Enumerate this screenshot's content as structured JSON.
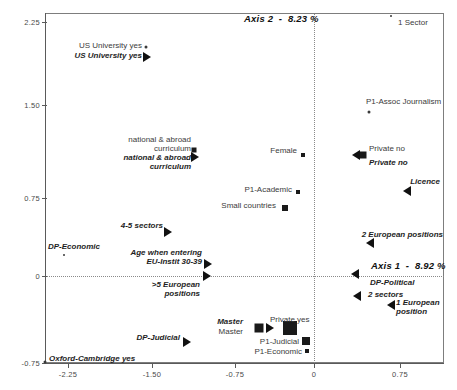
{
  "chart_data": {
    "type": "scatter",
    "title": "",
    "xlabel": "Axis 1 - 8.92 %",
    "ylabel": "Axis 2 - 8.23 %",
    "axis1_label": "Axis 1  -  8.92 %",
    "axis2_label": "Axis 2  -  8.23 %",
    "axis1_inertia_pct": 8.92,
    "axis2_inertia_pct": 8.23,
    "grid": "zero-axes-dotted",
    "legend": "none",
    "xlim": [
      -2.72,
      1.13
    ],
    "ylim": [
      -0.8,
      2.37
    ],
    "xticks": [
      -2.25,
      -1.5,
      -0.75,
      0,
      0.75
    ],
    "xticklabels": [
      "-2.25",
      "-1.50",
      "-0.75",
      "0",
      "0.75"
    ],
    "yticks": [
      2.25,
      1.5,
      0.75,
      0,
      -0.75
    ],
    "yticklabels": [
      "2.25",
      "1.50",
      "0.75",
      "0",
      "-0.75"
    ],
    "points": [
      {
        "label": "1 Sector",
        "style": "reg",
        "x": 0.7,
        "y": 2.28,
        "marker": "dot",
        "size": 2,
        "lx": 398,
        "ly": 19,
        "anchor": "left",
        "mx": 391,
        "my": 16
      },
      {
        "label": "US University yes",
        "style": "reg",
        "x": -1.53,
        "y": 2.03,
        "marker": "dot",
        "size": 3,
        "lx": 142,
        "ly": 42,
        "anchor": "right",
        "mx": 146,
        "my": 47
      },
      {
        "label": "US University yes",
        "style": "ital",
        "x": -1.53,
        "y": 1.98,
        "marker": "tri-r",
        "size": 0,
        "lx": 142,
        "ly": 52,
        "anchor": "right",
        "mx": 147,
        "my": 57
      },
      {
        "label": "P1-Assoc Journalism",
        "style": "reg",
        "x": 0.49,
        "y": 1.45,
        "marker": "dot",
        "size": 3,
        "lx": 366,
        "ly": 98,
        "anchor": "left",
        "mx": 369,
        "my": 112
      },
      {
        "label": "national & abroad\ncurriculum",
        "style": "reg",
        "x": -1.09,
        "y": 1.09,
        "marker": "sq",
        "size": 5,
        "lx": 191,
        "ly": 136,
        "anchor": "right",
        "mx": 194,
        "my": 150
      },
      {
        "label": "national & abroad\ncurriculum",
        "style": "ital",
        "x": -1.09,
        "y": 1.03,
        "marker": "tri-r",
        "size": 0,
        "lx": 191,
        "ly": 154,
        "anchor": "right",
        "mx": 195,
        "my": 157
      },
      {
        "label": "Female",
        "style": "reg",
        "x": -0.09,
        "y": 1.04,
        "marker": "sq",
        "size": 4,
        "lx": 297,
        "ly": 147,
        "anchor": "right",
        "mx": 303,
        "my": 155
      },
      {
        "label": "Private no",
        "style": "reg",
        "x": 0.44,
        "y": 1.04,
        "marker": "sq",
        "size": 7,
        "lx": 369,
        "ly": 145,
        "anchor": "left",
        "mx": 363,
        "my": 155
      },
      {
        "label": "Private no",
        "style": "ital",
        "x": 0.44,
        "y": 1.01,
        "marker": "tri-l",
        "size": 0,
        "lx": 369,
        "ly": 159,
        "anchor": "left",
        "mx": 356,
        "my": 155
      },
      {
        "label": "Licence",
        "style": "ital",
        "x": 0.81,
        "y": 0.84,
        "marker": "tri-l",
        "size": 0,
        "lx": 440,
        "ly": 178,
        "anchor": "right",
        "mx": 407,
        "my": 191
      },
      {
        "label": "P1-Academic",
        "style": "reg",
        "x": -0.14,
        "y": 0.72,
        "marker": "sq",
        "size": 4,
        "lx": 292,
        "ly": 186,
        "anchor": "right",
        "mx": 298,
        "my": 192
      },
      {
        "label": "Small countries",
        "style": "reg",
        "x": -0.27,
        "y": 0.59,
        "marker": "sq",
        "size": 6,
        "lx": 276,
        "ly": 202,
        "anchor": "right",
        "mx": 285,
        "my": 208
      },
      {
        "label": "4-5 sectors",
        "style": "ital",
        "x": -1.32,
        "y": 0.41,
        "marker": "tri-r",
        "size": 0,
        "lx": 163,
        "ly": 222,
        "anchor": "right",
        "mx": 168,
        "my": 232
      },
      {
        "label": "2 European positions",
        "style": "ital",
        "x": 0.5,
        "y": 0.3,
        "marker": "tri-l",
        "size": 0,
        "lx": 443,
        "ly": 231,
        "anchor": "right",
        "mx": 370,
        "my": 243
      },
      {
        "label": "DP-Economic",
        "style": "ital",
        "x": -2.23,
        "y": 0.18,
        "marker": "dot",
        "size": 2,
        "lx": 100,
        "ly": 243,
        "anchor": "right",
        "mx": 64,
        "my": 255
      },
      {
        "label": "Age when entering\nEU-Instit 30-39",
        "style": "ital",
        "x": -0.97,
        "y": 0.11,
        "marker": "tri-r",
        "size": 0,
        "lx": 202,
        "ly": 249,
        "anchor": "right",
        "mx": 208,
        "my": 264
      },
      {
        "label": "Axis 1  -  8.92 %",
        "style": "axis",
        "x": 0.4,
        "y": 0.01,
        "marker": "tri-l",
        "size": 0,
        "lx": 371,
        "ly": 263,
        "anchor": "left",
        "mx": 355,
        "my": 274
      },
      {
        "label": "DP-Political",
        "style": "ital",
        "x": 0.4,
        "y": -0.03,
        "marker": "none",
        "size": 0,
        "lx": 370,
        "ly": 279,
        "anchor": "left",
        "mx": 0,
        "my": 0
      },
      {
        "label": ">5 European\npositions",
        "style": "ital",
        "x": -0.97,
        "y": -0.02,
        "marker": "tri-r",
        "size": 0,
        "lx": 200,
        "ly": 281,
        "anchor": "right",
        "mx": 207,
        "my": 276
      },
      {
        "label": "2 sectors",
        "style": "ital",
        "x": 0.42,
        "y": -0.2,
        "marker": "tri-l",
        "size": 0,
        "lx": 368,
        "ly": 291,
        "anchor": "left",
        "mx": 357,
        "my": 296
      },
      {
        "label": "1 European\nposition",
        "style": "ital",
        "x": 0.73,
        "y": -0.27,
        "marker": "tri-l",
        "size": 0,
        "lx": 396,
        "ly": 299,
        "anchor": "left",
        "mx": 391,
        "my": 305
      },
      {
        "label": "Master",
        "style": "ital",
        "x": -0.52,
        "y": -0.45,
        "marker": "tri-r",
        "size": 0,
        "lx": 243,
        "ly": 318,
        "anchor": "right",
        "mx": 270,
        "my": 328
      },
      {
        "label": "Master",
        "style": "reg",
        "x": -0.52,
        "y": -0.45,
        "marker": "sq",
        "size": 9,
        "lx": 243,
        "ly": 328,
        "anchor": "right",
        "mx": 259,
        "my": 328
      },
      {
        "label": "Private yes",
        "style": "reg",
        "x": -0.24,
        "y": -0.45,
        "marker": "sq",
        "size": 14,
        "lx": 270,
        "ly": 316,
        "anchor": "left",
        "mx": 290,
        "my": 328
      },
      {
        "label": "P1-Judicial",
        "style": "reg",
        "x": -0.06,
        "y": -0.57,
        "marker": "sq",
        "size": 8,
        "lx": 299,
        "ly": 338,
        "anchor": "right",
        "mx": 306,
        "my": 341
      },
      {
        "label": "P1-Economic",
        "style": "reg",
        "x": -0.06,
        "y": -0.66,
        "marker": "sq",
        "size": 4,
        "lx": 302,
        "ly": 348,
        "anchor": "right",
        "mx": 307,
        "my": 351
      },
      {
        "label": "DP-Judicial",
        "style": "ital",
        "x": -1.2,
        "y": -0.57,
        "marker": "tri-r",
        "size": 0,
        "lx": 180,
        "ly": 334,
        "anchor": "right",
        "mx": 187,
        "my": 342
      },
      {
        "label": "Oxford-Cambridge yes",
        "style": "ital",
        "x": -2.7,
        "y": -0.74,
        "marker": "dot",
        "size": 3,
        "lx": 49,
        "ly": 355,
        "anchor": "left",
        "mx": 45,
        "my": 362
      }
    ]
  },
  "axes": {
    "x_ticks": [
      {
        "label": "-2.25",
        "px": 68
      },
      {
        "label": "-1.50",
        "px": 152
      },
      {
        "label": "-0.75",
        "px": 235
      },
      {
        "label": "0",
        "px": 314
      },
      {
        "label": "0.75",
        "px": 400
      }
    ],
    "y_ticks": [
      {
        "label": "2.25",
        "px": 22
      },
      {
        "label": "1.50",
        "px": 105
      },
      {
        "label": "0.75",
        "px": 198
      },
      {
        "label": "0",
        "px": 276
      },
      {
        "label": "-0.75",
        "px": 363
      }
    ],
    "axis2_title": "Axis 2  -  8.23 %",
    "axis2_title_x": 244,
    "axis2_title_y": 13,
    "axis1_title": "Axis 1  -  8.92 %",
    "axis1_title_x": 371,
    "axis1_title_y": 260
  },
  "colors": {
    "background": "#ffffff",
    "frame": "#7d7d7d",
    "axis": "#5a5a5a",
    "marker": "#1a1a1a",
    "label_regular": "#3b3b3b",
    "label_italic": "#1e1e1e"
  }
}
